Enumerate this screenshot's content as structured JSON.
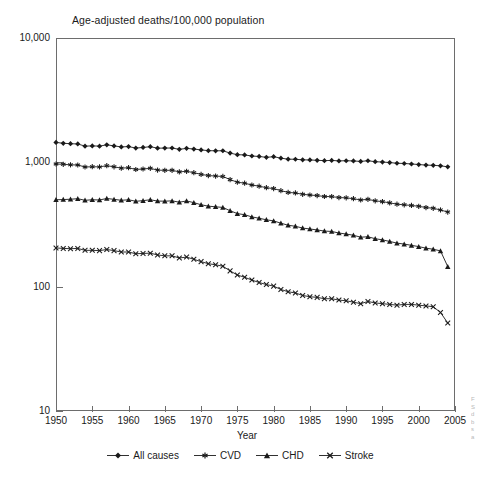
{
  "figure": {
    "title": "Age-adjusted deaths/100,000 population",
    "x_axis_title": "Year",
    "edge_caption_lines": [
      "F",
      "S",
      "d",
      "b",
      "s",
      "a"
    ]
  },
  "axes": {
    "y_tick_labels": [
      "10,000",
      "1,000",
      "100",
      "10"
    ],
    "x_tick_labels": [
      "1950",
      "1955",
      "1960",
      "1965",
      "1970",
      "1975",
      "1980",
      "1985",
      "1990",
      "1995",
      "2000",
      "2005"
    ]
  },
  "legend": {
    "items": [
      {
        "label": "All causes",
        "marker": "diamond-marker-icon",
        "color": "#1a1a1a"
      },
      {
        "label": "CVD",
        "marker": "asterisk-marker-icon",
        "color": "#1a1a1a"
      },
      {
        "label": "CHD",
        "marker": "triangle-marker-icon",
        "color": "#1a1a1a"
      },
      {
        "label": "Stroke",
        "marker": "x-marker-icon",
        "color": "#1a1a1a"
      }
    ]
  },
  "chart_data": {
    "type": "line",
    "title": "Age-adjusted deaths/100,000 population",
    "xlabel": "Year",
    "ylabel": "",
    "yscale": "log",
    "ylim": [
      10,
      10000
    ],
    "xlim": [
      1950,
      2005
    ],
    "grid": false,
    "legend_position": "bottom",
    "y_ticks": [
      10,
      100,
      1000,
      10000
    ],
    "y_tick_labels": [
      "10",
      "100",
      "1,000",
      "10,000"
    ],
    "x_ticks": [
      1950,
      1955,
      1960,
      1965,
      1970,
      1975,
      1980,
      1985,
      1990,
      1995,
      2000,
      2005
    ],
    "x": [
      1950,
      1951,
      1952,
      1953,
      1954,
      1955,
      1956,
      1957,
      1958,
      1959,
      1960,
      1961,
      1962,
      1963,
      1964,
      1965,
      1966,
      1967,
      1968,
      1969,
      1970,
      1971,
      1972,
      1973,
      1974,
      1975,
      1976,
      1977,
      1978,
      1979,
      1980,
      1981,
      1982,
      1983,
      1984,
      1985,
      1986,
      1987,
      1988,
      1989,
      1990,
      1991,
      1992,
      1993,
      1994,
      1995,
      1996,
      1997,
      1998,
      1999,
      2000,
      2001,
      2002,
      2003,
      2004
    ],
    "series": [
      {
        "name": "All causes",
        "marker": "diamond",
        "color": "#1a1a1a",
        "values": [
          1446,
          1423,
          1412,
          1405,
          1350,
          1356,
          1350,
          1383,
          1356,
          1330,
          1339,
          1302,
          1317,
          1336,
          1300,
          1302,
          1304,
          1272,
          1295,
          1279,
          1259,
          1241,
          1238,
          1239,
          1186,
          1152,
          1147,
          1124,
          1115,
          1097,
          1110,
          1081,
          1060,
          1059,
          1047,
          1045,
          1038,
          1032,
          1036,
          1027,
          1030,
          1026,
          1017,
          1030,
          1012,
          1005,
          996,
          983,
          979,
          970,
          960,
          950,
          946,
          938,
          920
        ]
      },
      {
        "name": "CVD",
        "marker": "asterisk",
        "color": "#1a1a1a",
        "values": [
          970,
          964,
          955,
          952,
          917,
          922,
          919,
          940,
          920,
          898,
          905,
          876,
          884,
          895,
          866,
          862,
          863,
          838,
          847,
          826,
          800,
          783,
          775,
          770,
          726,
          692,
          680,
          657,
          643,
          625,
          615,
          592,
          573,
          567,
          553,
          546,
          540,
          531,
          530,
          521,
          518,
          510,
          498,
          504,
          490,
          483,
          472,
          461,
          455,
          450,
          443,
          433,
          427,
          414,
          398
        ]
      },
      {
        "name": "CHD",
        "marker": "triangle",
        "color": "#1a1a1a",
        "values": [
          500,
          502,
          505,
          510,
          495,
          500,
          498,
          512,
          504,
          495,
          500,
          486,
          492,
          500,
          488,
          487,
          490,
          478,
          489,
          474,
          456,
          444,
          439,
          434,
          408,
          387,
          379,
          364,
          355,
          345,
          338,
          324,
          312,
          306,
          296,
          291,
          286,
          280,
          278,
          270,
          265,
          259,
          250,
          252,
          243,
          238,
          231,
          224,
          220,
          215,
          210,
          204,
          200,
          194,
          145
        ]
      },
      {
        "name": "Stroke",
        "marker": "x",
        "color": "#1a1a1a",
        "values": [
          205,
          203,
          202,
          203,
          196,
          196,
          195,
          199,
          195,
          190,
          190,
          184,
          185,
          186,
          180,
          177,
          177,
          170,
          173,
          166,
          159,
          153,
          150,
          146,
          134,
          124,
          119,
          113,
          108,
          104,
          101,
          95,
          91,
          89,
          85,
          83,
          82,
          80,
          80,
          78,
          77,
          75,
          73,
          76,
          74,
          73,
          72,
          71,
          72,
          72,
          71,
          70,
          69,
          62,
          51
        ]
      }
    ]
  }
}
